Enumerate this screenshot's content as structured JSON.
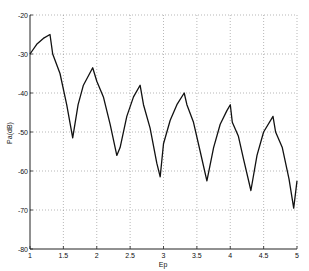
{
  "chart_data": {
    "type": "line",
    "title": "",
    "xlabel": "Ep",
    "ylabel": "Pa(dB)",
    "xlim": [
      1,
      5
    ],
    "ylim": [
      -80,
      -20
    ],
    "xticks": [
      1,
      1.5,
      2,
      2.5,
      3,
      3.5,
      4,
      4.5,
      5
    ],
    "xtick_labels": [
      "1",
      "1.5",
      "2",
      "2.5",
      "3",
      "3.5",
      "4",
      "4.5",
      "5"
    ],
    "yticks": [
      -20,
      -30,
      -40,
      -50,
      -60,
      -70,
      -80
    ],
    "ytick_labels": [
      "-20",
      "-30",
      "-40",
      "-50",
      "-60",
      "-70",
      "-80"
    ],
    "grid": true,
    "grid_style": "dotted",
    "legend": null,
    "series": [
      {
        "name": "Pa",
        "color": "#111111",
        "x": [
          1.0,
          1.1,
          1.2,
          1.3,
          1.34,
          1.45,
          1.55,
          1.64,
          1.72,
          1.8,
          1.94,
          2.0,
          2.1,
          2.2,
          2.3,
          2.35,
          2.45,
          2.55,
          2.65,
          2.7,
          2.8,
          2.9,
          2.95,
          3.0,
          3.1,
          3.2,
          3.31,
          3.35,
          3.45,
          3.55,
          3.65,
          3.75,
          3.85,
          3.95,
          4.0,
          4.03,
          4.12,
          4.2,
          4.31,
          4.4,
          4.5,
          4.64,
          4.68,
          4.78,
          4.88,
          4.95,
          5.0
        ],
        "y": [
          -30,
          -27.5,
          -26,
          -25,
          -30,
          -35,
          -43,
          -51.5,
          -43,
          -38,
          -33.5,
          -37,
          -41,
          -48,
          -56,
          -54,
          -46,
          -41,
          -38,
          -43,
          -49,
          -58,
          -61.5,
          -53,
          -47,
          -43,
          -40,
          -43,
          -47.5,
          -55,
          -62.5,
          -54,
          -48,
          -44.5,
          -43,
          -47.5,
          -51,
          -57,
          -65,
          -56,
          -50,
          -46,
          -50,
          -54,
          -62,
          -69.5,
          -62.5
        ]
      }
    ]
  }
}
